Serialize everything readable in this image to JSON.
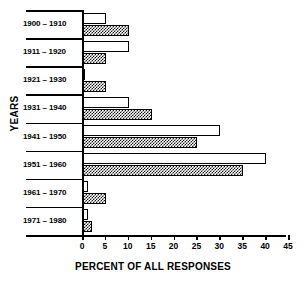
{
  "chart_data": {
    "type": "bar",
    "title": "",
    "orientation": "horizontal",
    "xlabel": "PERCENT OF ALL RESPONSES",
    "ylabel": "YEARS",
    "xlim": [
      0,
      45
    ],
    "xticks": [
      0,
      5,
      10,
      15,
      20,
      25,
      30,
      35,
      40,
      45
    ],
    "grid": false,
    "legend": "none",
    "categories": [
      "1900 – 1910",
      "1911 – 1920",
      "1921 – 1930",
      "1931 – 1940",
      "1941 – 1950",
      "1951 – 1960",
      "1961 – 1970",
      "1971 – 1980"
    ],
    "series": [
      {
        "name": "open",
        "style": "white-open-bar",
        "values": [
          5,
          10,
          0.5,
          10,
          30,
          40,
          1,
          1
        ]
      },
      {
        "name": "checkered",
        "style": "checkerboard-hatch-bar",
        "values": [
          10,
          5,
          5,
          15,
          25,
          35,
          5,
          2
        ]
      }
    ]
  },
  "axis": {
    "x_tick_labels": [
      "0",
      "5",
      "10",
      "15",
      "20",
      "25",
      "30",
      "35",
      "40",
      "45"
    ],
    "x_title": "PERCENT OF ALL RESPONSES",
    "y_title": "YEARS"
  },
  "colors": {
    "ink": "#000000",
    "background": "#ffffff",
    "hatch": "#1a1a1a"
  }
}
